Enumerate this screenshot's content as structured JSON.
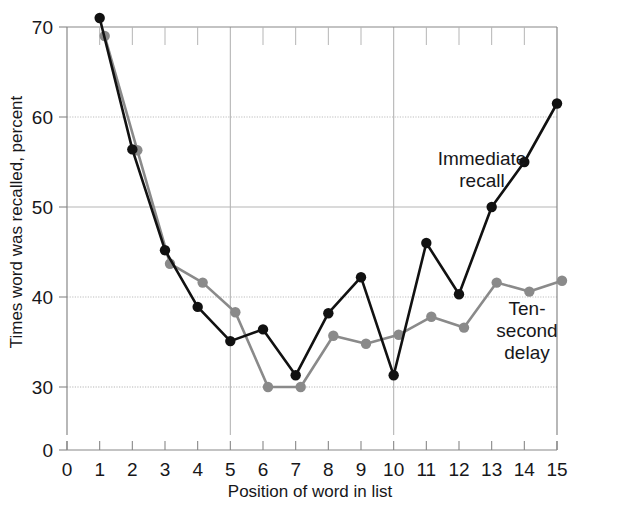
{
  "chart_data": {
    "type": "line",
    "title": "",
    "xlabel": "Position of word in list",
    "ylabel": "Times word was recalled, percent",
    "xlim": [
      0,
      15
    ],
    "ylim": [
      30,
      70
    ],
    "y_axis_break": true,
    "y_zero_label": "0",
    "xticks": [
      0,
      1,
      2,
      3,
      4,
      5,
      6,
      7,
      8,
      9,
      10,
      11,
      12,
      13,
      14,
      15
    ],
    "xticklabels": [
      "0",
      "1",
      "2",
      "3",
      "4",
      "5",
      "6",
      "7",
      "8",
      "9",
      "10",
      "11",
      "12",
      "13",
      "14",
      "15"
    ],
    "yticks": [
      30,
      40,
      50,
      60,
      70
    ],
    "yticklabels": [
      "30",
      "40",
      "50",
      "60",
      "70"
    ],
    "grid": true,
    "gridlines_y": [
      30,
      40,
      50,
      60,
      70
    ],
    "gridlines_x": [
      5,
      10
    ],
    "legend": "inline-annotations",
    "x": [
      1,
      2,
      3,
      4,
      5,
      6,
      7,
      8,
      9,
      10,
      11,
      12,
      13,
      14,
      15
    ],
    "series": [
      {
        "name": "Immediate recall",
        "color": "#111111",
        "marker": "circle",
        "label_lines": [
          "Immediate",
          "recall"
        ],
        "values": [
          71.0,
          56.4,
          45.2,
          38.9,
          35.1,
          36.4,
          31.3,
          38.2,
          42.2,
          31.3,
          46.0,
          40.3,
          50.0,
          55.0,
          61.5
        ]
      },
      {
        "name": "Ten-second delay",
        "color": "#8a8a8a",
        "marker": "circle",
        "label_lines": [
          "Ten-",
          "second",
          "delay"
        ],
        "values": [
          69.0,
          56.3,
          43.7,
          41.6,
          38.3,
          30.0,
          30.0,
          35.7,
          34.8,
          35.8,
          37.8,
          36.6,
          41.6,
          40.6,
          41.8
        ]
      }
    ],
    "annotations": [
      {
        "text": "Immediate recall",
        "x": 12.0,
        "y": 56.0
      },
      {
        "text": "Ten-second delay",
        "x": 13.0,
        "y": 38.5
      }
    ],
    "colors": {
      "immediate_recall": "#111111",
      "ten_second_delay": "#8a8a8a",
      "axis": "#888888",
      "grid": "#b5b5b5",
      "text": "#17171a",
      "background": "#ffffff"
    }
  },
  "axis": {
    "y_title": "Times word was recalled, percent",
    "x_title": "Position of word in list",
    "y_zero": "0",
    "y_labels": [
      "70",
      "60",
      "50",
      "40",
      "30"
    ],
    "x_labels": [
      "0",
      "1",
      "2",
      "3",
      "4",
      "5",
      "6",
      "7",
      "8",
      "9",
      "10",
      "11",
      "12",
      "13",
      "14",
      "15"
    ]
  },
  "labels": {
    "immediate_line1": "Immediate",
    "immediate_line2": "recall",
    "delay_line1": "Ten-",
    "delay_line2": "second",
    "delay_line3": "delay"
  }
}
